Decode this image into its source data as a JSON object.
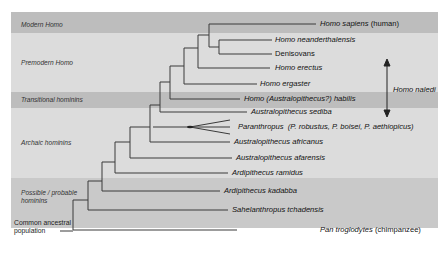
{
  "bands": [
    {
      "label": "Modern Homo",
      "color": "#bdbdbd"
    },
    {
      "label": "Premodern Homo",
      "color": "#dcdcdc"
    },
    {
      "label": "Transitional hominins",
      "color": "#bdbdbd"
    },
    {
      "label": "Archaic hominins",
      "color": "#dcdcdc"
    },
    {
      "label": "Possible / probable hominins",
      "color": "#c9c9c9"
    }
  ],
  "root_label": "Common ancestral population",
  "leaves": [
    {
      "italic": "Homo sapiens",
      "plain": " (human)"
    },
    {
      "italic": "Homo neanderthalensis",
      "plain": ""
    },
    {
      "italic": "",
      "plain": "Denisovans"
    },
    {
      "italic": "Homo erectus",
      "plain": ""
    },
    {
      "italic": "Homo ergaster",
      "plain": ""
    },
    {
      "italic": "Homo (Australopithecus?) habilis",
      "plain": ""
    },
    {
      "italic": "Australopithecus sediba",
      "plain": ""
    },
    {
      "italic": "Paranthropus  (P. robustus, P. boisei, P. aethiopicus)",
      "plain": ""
    },
    {
      "italic": "Australopithecus africanus",
      "plain": ""
    },
    {
      "italic": "Australopithecus afarensis",
      "plain": ""
    },
    {
      "italic": "Ardipithecus ramidus",
      "plain": ""
    },
    {
      "italic": "Ardipithecus kadabba",
      "plain": ""
    },
    {
      "italic": "Sahelanthropus tchadensis",
      "plain": ""
    },
    {
      "italic": "Pan troglodytes",
      "plain": " (chimpanzee)"
    }
  ],
  "annotation": {
    "label": "Homo naledi",
    "arrow": "double-headed vertical arrow"
  },
  "colors": {
    "line": "#3a3a3a",
    "text": "#111111"
  }
}
